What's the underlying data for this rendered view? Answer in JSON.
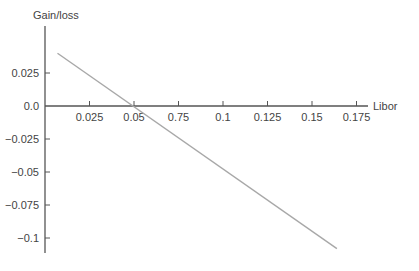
{
  "chart_data": {
    "type": "line",
    "title": "",
    "xlabel": "Libor",
    "ylabel": "Gain/loss",
    "x_ticks": [
      "0.025",
      "0.05",
      "0.75",
      "0.1",
      "0.125",
      "0.15",
      "0.175"
    ],
    "y_ticks": [
      "0.025",
      "0.0",
      "−0.025",
      "−0.05",
      "−0.075",
      "−0.1"
    ],
    "xlim": [
      0.0,
      0.18
    ],
    "ylim": [
      -0.11,
      0.05
    ],
    "grid": false,
    "legend": null,
    "series": [
      {
        "name": "Gain/loss",
        "color": "#a8a8a8",
        "x": [
          0.007,
          0.164
        ],
        "y": [
          0.04,
          -0.108
        ]
      }
    ]
  },
  "colors": {
    "axis": "#555555",
    "line": "#a8a8a8",
    "text": "#444444",
    "background": "#ffffff"
  }
}
